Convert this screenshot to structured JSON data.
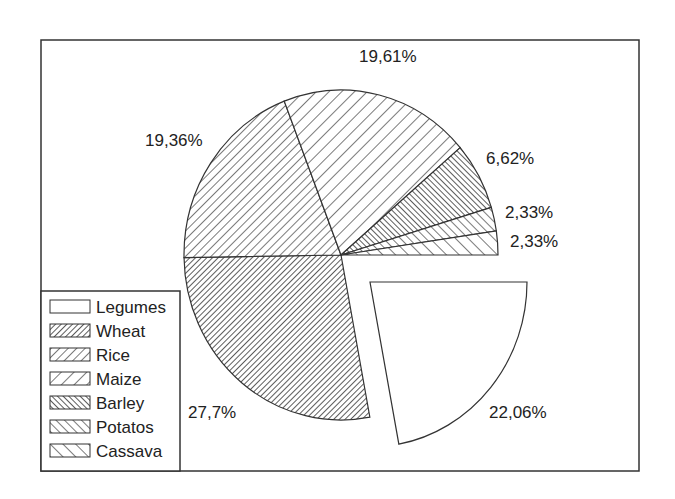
{
  "chart_data": {
    "type": "pie",
    "title": "",
    "categories": [
      "Legumes",
      "Wheat",
      "Rice",
      "Maize",
      "Barley",
      "Potatos",
      "Cassava"
    ],
    "values": [
      22.06,
      27.7,
      19.36,
      19.61,
      6.62,
      2.33,
      2.33
    ],
    "value_labels": [
      "22,06%",
      "27,7%",
      "19,36%",
      "19,61%",
      "6,62%",
      "2,33%",
      "2,33%"
    ],
    "exploded": [
      "Legumes"
    ],
    "start_angle_deg": 0,
    "direction": "clockwise",
    "legend_position": "bottom-left (inside frame)",
    "fill_patterns": {
      "Legumes": "none",
      "Wheat": "dense forward hatch",
      "Rice": "medium forward hatch",
      "Maize": "sparse forward hatch",
      "Barley": "dense backward hatch",
      "Potatos": "medium backward hatch",
      "Cassava": "sparse backward hatch"
    }
  },
  "legend": {
    "items": [
      {
        "label": "Legumes",
        "pattern": "none"
      },
      {
        "label": "Wheat",
        "pattern": "fwd-dense"
      },
      {
        "label": "Rice",
        "pattern": "fwd-med"
      },
      {
        "label": "Maize",
        "pattern": "fwd-sparse"
      },
      {
        "label": "Barley",
        "pattern": "back-dense"
      },
      {
        "label": "Potatos",
        "pattern": "back-med"
      },
      {
        "label": "Cassava",
        "pattern": "back-sparse"
      }
    ]
  },
  "colors": {
    "stroke": "#333333",
    "background": "#ffffff",
    "text": "#222222"
  }
}
